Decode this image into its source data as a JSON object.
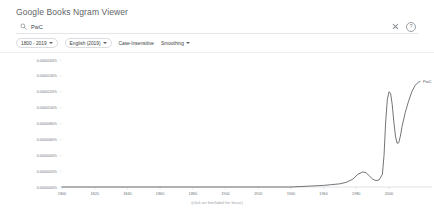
{
  "header": {
    "title": "Google Books Ngram Viewer"
  },
  "search": {
    "icon": "search-icon",
    "query": "PwC",
    "placeholder": "Enter comma-separated phrases",
    "clear_icon": "close-icon",
    "help_icon": "help-icon",
    "help_glyph": "?"
  },
  "filters": [
    {
      "label": "1800 - 2019",
      "name": "year-range",
      "type": "chip",
      "caret": true
    },
    {
      "label": "English (2019)",
      "name": "corpus",
      "type": "chip",
      "caret": true
    },
    {
      "label": "Case-Insensitive",
      "name": "case-insensitive",
      "type": "menu",
      "caret": false
    },
    {
      "label": "Smoothing",
      "name": "smoothing",
      "type": "menu",
      "caret": true
    }
  ],
  "chart_footer": "(click on line/label for focus)",
  "chart_data": {
    "type": "line",
    "title": "",
    "xlabel": "",
    "ylabel": "",
    "xlim": [
      1800,
      2019
    ],
    "ylim": [
      0,
      1.6e-05
    ],
    "grid": false,
    "legend_position": "right-end-label",
    "xticks": [
      1800,
      1820,
      1840,
      1860,
      1880,
      1900,
      1920,
      1940,
      1960,
      1980,
      2000
    ],
    "xticklabels": [
      "1800",
      "1820",
      "1840",
      "1860",
      "1880",
      "1900",
      "1920",
      "1940",
      "1960",
      "1980",
      "2000"
    ],
    "yticks": [
      0.0,
      2e-06,
      4e-06,
      6e-06,
      8e-06,
      1e-05,
      1.2e-05,
      1.4e-05,
      1.6e-05
    ],
    "yticklabels": [
      "0.0000000%",
      "0.0000020%",
      "0.0000040%",
      "0.0000060%",
      "0.0000080%",
      "0.0000100%",
      "0.0000120%",
      "0.0000140%",
      "0.0000160%"
    ],
    "series": [
      {
        "name": "PwC",
        "color": "#4e5256",
        "end_label": "PwC",
        "x": [
          1800,
          1820,
          1840,
          1860,
          1880,
          1900,
          1920,
          1940,
          1950,
          1960,
          1965,
          1970,
          1974,
          1978,
          1981,
          1984,
          1986,
          1988,
          1990,
          1992,
          1994,
          1996,
          1997,
          1998,
          1999,
          2000,
          2001,
          2002,
          2003,
          2004,
          2005,
          2006,
          2007,
          2008,
          2010,
          2012,
          2014,
          2016,
          2018,
          2019
        ],
        "y": [
          0.0,
          0.0,
          0.0,
          0.0,
          0.0,
          0.0,
          0.0,
          0.0,
          1e-07,
          2e-07,
          3e-07,
          4e-07,
          6e-07,
          1e-06,
          1.6e-06,
          1.9e-06,
          1.8e-06,
          1.4e-06,
          1e-06,
          8e-07,
          9e-07,
          1.6e-06,
          4e-06,
          8.2e-06,
          1.1e-05,
          1.2e-05,
          1.18e-05,
          1.04e-05,
          8.2e-06,
          6.4e-06,
          5.5e-06,
          5.6e-06,
          6.4e-06,
          7.6e-06,
          9.4e-06,
          1.08e-05,
          1.2e-05,
          1.28e-05,
          1.32e-05,
          1.33e-05
        ]
      }
    ]
  }
}
